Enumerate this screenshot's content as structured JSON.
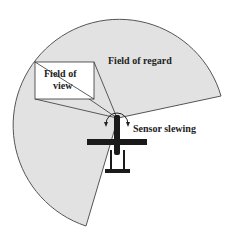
{
  "diagram": {
    "labels": {
      "field_of_regard": "Field of regard",
      "field_of_view_line1": "Field of",
      "field_of_view_line2": "view",
      "sensor_slewing": "Sensor slewing"
    },
    "colors": {
      "regard_fill": "#e2e2e2",
      "outline": "#555555",
      "aircraft": "#1a1a1a",
      "view_box": "#ffffff"
    }
  }
}
